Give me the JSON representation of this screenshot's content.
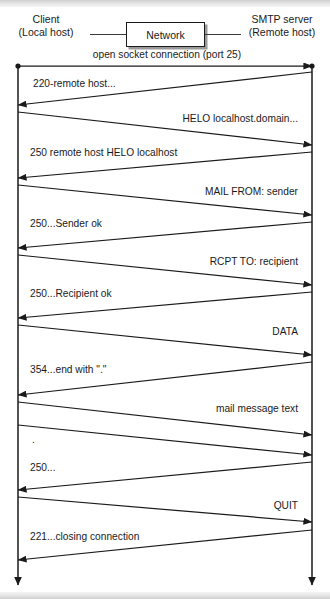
{
  "diagram": {
    "colors": {
      "line": "#1a1a1a",
      "wire": "#3a3a3a",
      "background": "#ffffff",
      "shadow": "#9a9a9a",
      "band": "#d8d8d8"
    },
    "header": {
      "client": {
        "line1": "Client",
        "line2": "(Local host)"
      },
      "network": {
        "label": "Network"
      },
      "server": {
        "line1": "SMTP server",
        "line2": "(Remote host)"
      }
    },
    "lifelines": [
      {
        "name": "client-lifeline",
        "x": 18,
        "top": 66,
        "bottom": 585
      },
      {
        "name": "server-lifeline",
        "x": 312,
        "top": 66,
        "bottom": 585
      }
    ],
    "messages": [
      {
        "label": "open socket connection (port 25)",
        "dir": "right",
        "align": "center",
        "y1": 66,
        "y2": 66,
        "labelX": 52,
        "labelY": 49,
        "labelW": 230
      },
      {
        "label": "220-remote host...",
        "dir": "left",
        "align": "left",
        "y1": 72,
        "y2": 105,
        "labelX": 33,
        "labelY": 78,
        "labelW": 200
      },
      {
        "label": "HELO localhost.domain...",
        "dir": "right",
        "align": "right",
        "y1": 112,
        "y2": 145,
        "labelX": 100,
        "labelY": 113,
        "labelW": 198
      },
      {
        "label": "250 remote host HELO localhost",
        "dir": "left",
        "align": "left",
        "y1": 152,
        "y2": 178,
        "labelX": 30,
        "labelY": 147,
        "labelW": 240
      },
      {
        "label": "MAIL FROM: sender",
        "dir": "right",
        "align": "right",
        "y1": 185,
        "y2": 215,
        "labelX": 100,
        "labelY": 186,
        "labelW": 198
      },
      {
        "label": "250...Sender ok",
        "dir": "left",
        "align": "left",
        "y1": 222,
        "y2": 248,
        "labelX": 30,
        "labelY": 218,
        "labelW": 200
      },
      {
        "label": "RCPT TO: recipient",
        "dir": "right",
        "align": "right",
        "y1": 255,
        "y2": 285,
        "labelX": 100,
        "labelY": 256,
        "labelW": 198
      },
      {
        "label": "250...Recipient ok",
        "dir": "left",
        "align": "left",
        "y1": 292,
        "y2": 318,
        "labelX": 30,
        "labelY": 288,
        "labelW": 200
      },
      {
        "label": "DATA",
        "dir": "right",
        "align": "right",
        "y1": 325,
        "y2": 355,
        "labelX": 180,
        "labelY": 326,
        "labelW": 118
      },
      {
        "label": "354...end with \".\"",
        "dir": "left",
        "align": "left",
        "y1": 362,
        "y2": 395,
        "labelX": 30,
        "labelY": 364,
        "labelW": 200
      },
      {
        "label": "mail message text",
        "dir": "right",
        "align": "right",
        "y1": 402,
        "y2": 435,
        "labelX": 100,
        "labelY": 403,
        "labelW": 198
      },
      {
        "label": ".",
        "dir": "right",
        "align": "left",
        "y1": 425,
        "y2": 455,
        "labelX": 32,
        "labelY": 434,
        "labelW": 120
      },
      {
        "label": "250...",
        "dir": "left",
        "align": "left",
        "y1": 462,
        "y2": 490,
        "labelX": 30,
        "labelY": 462,
        "labelW": 160
      },
      {
        "label": "QUIT",
        "dir": "right",
        "align": "right",
        "y1": 497,
        "y2": 522,
        "labelX": 180,
        "labelY": 500,
        "labelW": 118
      },
      {
        "label": "221...closing connection",
        "dir": "left",
        "align": "left",
        "y1": 530,
        "y2": 560,
        "labelX": 30,
        "labelY": 531,
        "labelW": 210
      }
    ]
  }
}
